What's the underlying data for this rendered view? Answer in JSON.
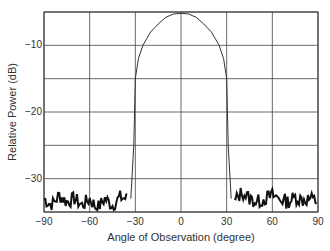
{
  "chart_data": {
    "type": "line",
    "title": "",
    "xlabel": "Angle of Observation (degree)",
    "ylabel": "Relative Power (dB)",
    "xlim": [
      -90,
      90
    ],
    "ylim": [
      -35,
      -5
    ],
    "xticks": [
      -90,
      -60,
      -30,
      0,
      30,
      60,
      90
    ],
    "yticks": [
      -10,
      -20,
      -30
    ],
    "grid": true,
    "legend": null,
    "series": [
      {
        "name": "Main lobe",
        "x": [
          -33,
          -31,
          -30,
          -28,
          -25,
          -20,
          -15,
          -10,
          -5,
          0,
          5,
          10,
          15,
          20,
          25,
          28,
          30,
          31,
          33
        ],
        "y": [
          -33,
          -25,
          -15,
          -12,
          -10,
          -8,
          -6.8,
          -5.8,
          -5.3,
          -5.2,
          -5.3,
          -5.8,
          -6.8,
          -8,
          -10,
          -12,
          -15,
          -25,
          -33
        ]
      },
      {
        "name": "Noise floor left",
        "x": [
          -90,
          -85,
          -80,
          -75,
          -70,
          -65,
          -60,
          -55,
          -50,
          -45,
          -40,
          -35
        ],
        "y": [
          -33,
          -34,
          -32.5,
          -33.5,
          -33,
          -34,
          -33,
          -34.5,
          -33,
          -34,
          -32.8,
          -33
        ]
      },
      {
        "name": "Noise floor right",
        "x": [
          35,
          40,
          45,
          50,
          55,
          60,
          65,
          70,
          75,
          80,
          85,
          90
        ],
        "y": [
          -33.5,
          -32,
          -33,
          -33.5,
          -33,
          -32.5,
          -33,
          -33.5,
          -32.8,
          -33.2,
          -33,
          -33.5
        ]
      }
    ]
  }
}
